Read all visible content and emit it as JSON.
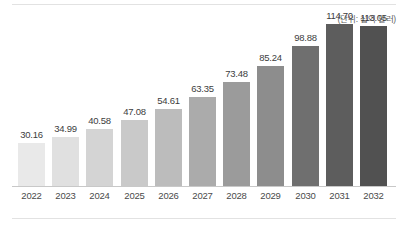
{
  "chart_data": {
    "type": "bar",
    "title": "",
    "subtitle": "",
    "unit_note": "(단위: 십억 달러)",
    "xlabel": "",
    "ylabel": "",
    "ylim": [
      0,
      113.05
    ],
    "grid": false,
    "legend": "none",
    "categories": [
      "2022",
      "2023",
      "2024",
      "2025",
      "2026",
      "2027",
      "2028",
      "2029",
      "2030",
      "2031",
      "2032"
    ],
    "values": [
      30.16,
      34.99,
      40.58,
      47.08,
      54.61,
      63.35,
      73.48,
      85.24,
      98.88,
      114.7,
      113.05
    ],
    "value_labels": [
      "30.16",
      "34.99",
      "40.58",
      "47.08",
      "54.61",
      "63.35",
      "73.48",
      "85.24",
      "98.88",
      "114.70",
      "113.05"
    ],
    "bar_colors": [
      "#e9e9e9",
      "#e0e0e0",
      "#d4d4d4",
      "#c9c9c9",
      "#bcbcbc",
      "#ababab",
      "#9b9b9b",
      "#8d8d8d",
      "#6f6f6f",
      "#5d5d5d",
      "#515151"
    ],
    "axis_color": "#c8c8c8",
    "label_color": "#3d3d3d",
    "background": "#ffffff"
  }
}
